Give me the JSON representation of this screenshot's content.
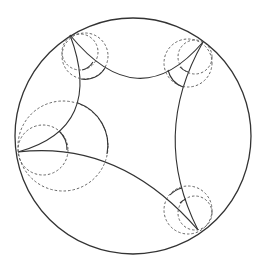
{
  "diagram": {
    "title": "",
    "type": "hyperbolic ideal quadrilateral in Poincare disk with horocycles",
    "colors": {
      "line": "#333333",
      "dashed": "#555555",
      "background": "#ffffff"
    },
    "boundary_circle": {
      "cx": 133,
      "cy": 136,
      "r": 118
    },
    "ideal_vertices": [
      {
        "id": "A",
        "x": 70,
        "y": 35
      },
      {
        "id": "B",
        "x": 203,
        "y": 42
      },
      {
        "id": "C",
        "x": 18,
        "y": 152
      },
      {
        "id": "D",
        "x": 198,
        "y": 230
      }
    ],
    "labels": []
  }
}
